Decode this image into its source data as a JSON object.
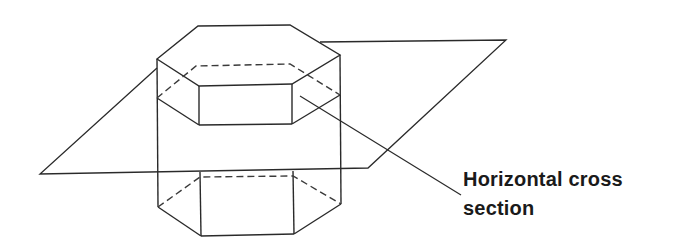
{
  "figure": {
    "type": "diagram",
    "label": {
      "line1": "Horizontal cross",
      "line2": "section"
    },
    "colors": {
      "stroke": "#2a2a2a",
      "background": "#ffffff",
      "text": "#1a1a1a"
    }
  }
}
